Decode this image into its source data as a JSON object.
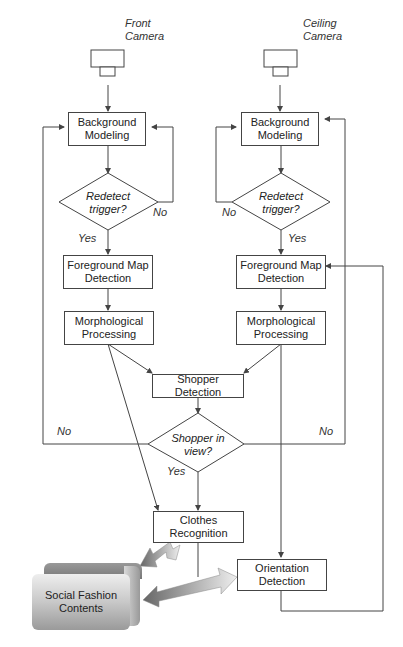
{
  "diagram": {
    "cameras": {
      "front": {
        "line1": "Front",
        "line2": "Camera"
      },
      "ceiling": {
        "line1": "Ceiling",
        "line2": "Camera"
      }
    },
    "left_branch": {
      "background_modeling": {
        "line1": "Background",
        "line2": "Modeling"
      },
      "redetect": {
        "line1": "Redetect",
        "line2": "trigger?"
      },
      "yes_label": "Yes",
      "no_label": "No",
      "foreground": {
        "line1": "Foreground Map",
        "line2": "Detection"
      },
      "morphological": {
        "line1": "Morphological",
        "line2": "Processing"
      }
    },
    "right_branch": {
      "background_modeling": {
        "line1": "Background",
        "line2": "Modeling"
      },
      "redetect": {
        "line1": "Redetect",
        "line2": "trigger?"
      },
      "yes_label": "Yes",
      "no_label": "No",
      "foreground": {
        "line1": "Foreground Map",
        "line2": "Detection"
      },
      "morphological": {
        "line1": "Morphological",
        "line2": "Processing"
      }
    },
    "shopper_detection": "Shopper Detection",
    "shopper_in_view": {
      "line1": "Shopper in",
      "line2": "view?"
    },
    "shopper_no_left": "No",
    "shopper_no_right": "No",
    "shopper_yes": "Yes",
    "clothes_recognition": {
      "line1": "Clothes",
      "line2": "Recognition"
    },
    "orientation_detection": {
      "line1": "Orientation",
      "line2": "Detection"
    },
    "social_fashion": {
      "line1": "Social Fashion",
      "line2": "Contents"
    }
  }
}
